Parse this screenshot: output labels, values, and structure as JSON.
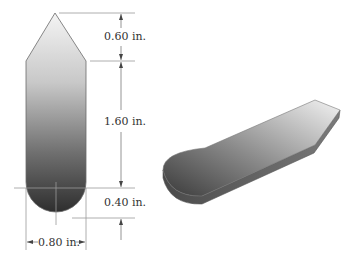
{
  "figure": {
    "type": "technical-drawing",
    "views": [
      "front-dimensioned",
      "isometric-3d"
    ]
  },
  "dimensions": {
    "tip_height": "0.60 in.",
    "body_height": "1.60 in.",
    "radius_height": "0.40 in.",
    "width": "0.80 in."
  },
  "colors": {
    "gradient_light": "#f2f2f2",
    "gradient_mid": "#a8a8a8",
    "gradient_dark": "#2e2e2e",
    "outline": "#6a6a6a",
    "dim_line": "#7a7a7a",
    "text": "#333333"
  }
}
